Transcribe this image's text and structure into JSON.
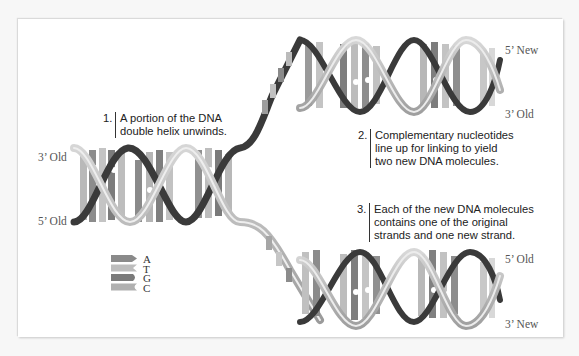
{
  "diagram": {
    "type": "DNA replication illustration",
    "steps": [
      {
        "number": "1.",
        "lines": [
          "A portion of the DNA",
          "double helix unwinds."
        ]
      },
      {
        "number": "2.",
        "lines": [
          "Complementary nucleotides",
          "line up for linking to yield",
          "two new DNA molecules."
        ]
      },
      {
        "number": "3.",
        "lines": [
          "Each of the new DNA molecules",
          "contains one of the original",
          "strands and one new strand."
        ]
      }
    ],
    "strand_ends": {
      "left_top": "3’ Old",
      "left_bottom": "5’ Old",
      "upper_right_top": "5’ New",
      "upper_right_bottom": "3’ Old",
      "lower_right_top": "5’ Old",
      "lower_right_bottom": "3’ New"
    },
    "legend": [
      {
        "letter": "A",
        "shape": "arrow-point",
        "color": "#8a8a8a"
      },
      {
        "letter": "T",
        "shape": "notch",
        "color": "#bdbdbd"
      },
      {
        "letter": "G",
        "shape": "rounded",
        "color": "#7a7a7a"
      },
      {
        "letter": "C",
        "shape": "cup",
        "color": "#b0b0b0"
      }
    ],
    "colors": {
      "old_strand": "#3c3c3c",
      "new_strand": "#a8a8a8",
      "backbone_light": "#c9c9c9",
      "background": "#ffffff"
    }
  }
}
